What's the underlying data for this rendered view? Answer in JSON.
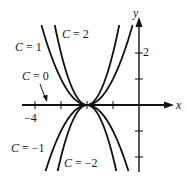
{
  "chart_data": {
    "type": "line",
    "title": "",
    "xlabel": "x",
    "ylabel": "y",
    "equation": "y = C(x + 2)^2",
    "xlim": [
      -5.1,
      1.6
    ],
    "ylim": [
      -2.55,
      3.5
    ],
    "x_ticks": [
      -4,
      -3,
      -2,
      -1
    ],
    "x_tick_labels": [
      {
        "value": -4,
        "label": "−4"
      }
    ],
    "y_ticks": [
      -2,
      -1,
      1,
      2
    ],
    "y_tick_labels": [
      {
        "value": 2,
        "label": "2"
      }
    ],
    "grid": false,
    "legend": null,
    "series": [
      {
        "name": "C = 2",
        "C": 2,
        "vertex": [
          -2,
          0
        ]
      },
      {
        "name": "C = 1",
        "C": 1,
        "vertex": [
          -2,
          0
        ]
      },
      {
        "name": "C = 0",
        "C": 0,
        "vertex": [
          -2,
          0
        ]
      },
      {
        "name": "C = −1",
        "C": -1,
        "vertex": [
          -2,
          0
        ]
      },
      {
        "name": "C = −2",
        "C": -2,
        "vertex": [
          -2,
          0
        ]
      }
    ],
    "annotations": [
      {
        "text": "C = 1",
        "pos": [
          15,
          47
        ]
      },
      {
        "text": "C = 2",
        "pos": [
          61,
          38
        ]
      },
      {
        "text": "C = 0",
        "pos": [
          22,
          77
        ]
      },
      {
        "text": "C = −1",
        "pos": [
          11,
          152
        ]
      },
      {
        "text": "C = −2",
        "pos": [
          64,
          167
        ]
      }
    ]
  },
  "layout": {
    "origin_px": [
      139,
      105
    ],
    "unit_px": 26,
    "curve_top_px": 25,
    "curve_bottom_px": 171
  },
  "labels": {
    "x_axis": "x",
    "y_axis": "y",
    "tick_x_neg4": "−4",
    "tick_y_2": "2",
    "c1": "C = 1",
    "c2": "C = 2",
    "c0": "C = 0",
    "cm1": "C = −1",
    "cm2": "C = −2"
  }
}
